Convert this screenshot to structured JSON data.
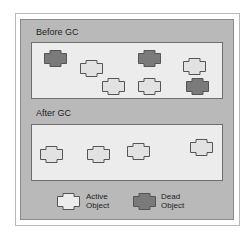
{
  "diagram": {
    "before": {
      "title": "Before GC",
      "objects": [
        {
          "state": "dead",
          "x": 44,
          "y": 50
        },
        {
          "state": "active",
          "x": 80,
          "y": 60
        },
        {
          "state": "active",
          "x": 102,
          "y": 78
        },
        {
          "state": "dead",
          "x": 138,
          "y": 50
        },
        {
          "state": "active",
          "x": 138,
          "y": 78
        },
        {
          "state": "active",
          "x": 183,
          "y": 58
        },
        {
          "state": "dead",
          "x": 186,
          "y": 78
        }
      ]
    },
    "after": {
      "title": "After GC",
      "objects": [
        {
          "state": "active",
          "x": 40,
          "y": 146
        },
        {
          "state": "active",
          "x": 87,
          "y": 146
        },
        {
          "state": "active",
          "x": 127,
          "y": 143
        },
        {
          "state": "active",
          "x": 190,
          "y": 139
        }
      ]
    },
    "legend": {
      "active_line1": "Active",
      "active_line2": "Object",
      "dead_line1": "Dead",
      "dead_line2": "Object"
    },
    "colors": {
      "active_fill": "#e2e2e2",
      "dead_fill": "#7a7a7a",
      "outline": "#555555"
    }
  }
}
